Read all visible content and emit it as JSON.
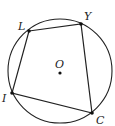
{
  "figure": {
    "type": "inscribed-quadrilateral",
    "circle": {
      "cx": 60,
      "cy": 71,
      "r": 52,
      "stroke": "#222222"
    },
    "center": {
      "label": "O",
      "x": 60,
      "y": 73,
      "label_x": 55,
      "label_y": 68
    },
    "vertices": [
      {
        "label": "L",
        "x": 29,
        "y": 31,
        "label_x": 18,
        "label_y": 30
      },
      {
        "label": "Y",
        "x": 81,
        "y": 24,
        "label_x": 84,
        "label_y": 20
      },
      {
        "label": "C",
        "x": 92,
        "y": 113,
        "label_x": 96,
        "label_y": 124
      },
      {
        "label": "I",
        "x": 12,
        "y": 93,
        "label_x": 2,
        "label_y": 102
      }
    ],
    "polygon_order": [
      "L",
      "Y",
      "C",
      "I"
    ],
    "line_color": "#222222"
  }
}
